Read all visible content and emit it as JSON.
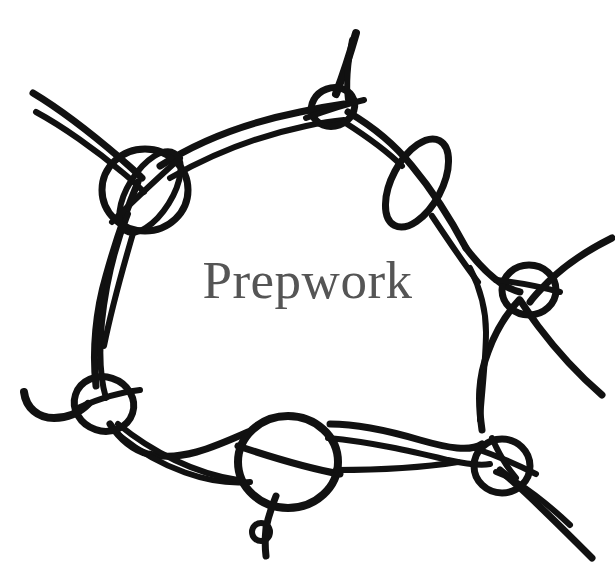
{
  "canvas": {
    "width": 615,
    "height": 586,
    "background_color": "#ffffff"
  },
  "label": {
    "text": "Prepwork",
    "color": "#555555",
    "font_size_px": 53,
    "style": "serif",
    "position": "center"
  },
  "artwork": {
    "kind": "hand-drawn knot network diagram",
    "stroke_color": "#111111",
    "stroke_width_px": 7,
    "description": "Closed loop of thick ink strands forming a rough pentagon ring, with circular bead nodes at each vertex and stray strand ends trailing off the canvas edges.",
    "nodes": [
      {
        "name": "top-bead",
        "cx": 333,
        "cy": 107,
        "rx": 22,
        "ry": 19,
        "rotation_deg": -20
      },
      {
        "name": "upper-left-bead",
        "cx": 145,
        "cy": 190,
        "rx": 43,
        "ry": 41,
        "rotation_deg": 0
      },
      {
        "name": "upper-left-inner-loop",
        "cx": 150,
        "cy": 192,
        "rx": 22,
        "ry": 45,
        "rotation_deg": 35
      },
      {
        "name": "right-teardrop",
        "cx": 417,
        "cy": 183,
        "rx": 25,
        "ry": 48,
        "rotation_deg": 28
      },
      {
        "name": "right-bead",
        "cx": 529,
        "cy": 290,
        "rx": 27,
        "ry": 24,
        "rotation_deg": 0
      },
      {
        "name": "left-lower-bead",
        "cx": 104,
        "cy": 404,
        "rx": 29,
        "ry": 27,
        "rotation_deg": 15
      },
      {
        "name": "bottom-bead",
        "cx": 288,
        "cy": 462,
        "rx": 49,
        "ry": 46,
        "rotation_deg": 0
      },
      {
        "name": "bottom-right-bead",
        "cx": 502,
        "cy": 466,
        "rx": 27,
        "ry": 26,
        "rotation_deg": 0
      },
      {
        "name": "tail-ringlet",
        "cx": 261,
        "cy": 532,
        "rx": 9,
        "ry": 9,
        "rotation_deg": 0
      }
    ],
    "loose_ends": [
      {
        "name": "upper-left-double-end",
        "x": 33,
        "y": 93
      },
      {
        "name": "upper-left-double-end-2",
        "x": 36,
        "y": 112
      },
      {
        "name": "top-spike-end",
        "x": 356,
        "y": 33
      },
      {
        "name": "right-upper-end",
        "x": 612,
        "y": 238
      },
      {
        "name": "right-lower-end",
        "x": 602,
        "y": 395
      },
      {
        "name": "left-hook-end",
        "x": 24,
        "y": 392
      },
      {
        "name": "bottom-right-end-1",
        "x": 592,
        "y": 558
      },
      {
        "name": "bottom-right-end-2",
        "x": 570,
        "y": 525
      },
      {
        "name": "tail-stem-end",
        "x": 266,
        "y": 556
      }
    ]
  }
}
